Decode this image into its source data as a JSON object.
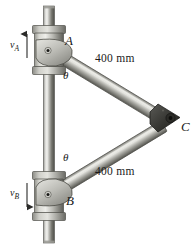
{
  "figure": {
    "name": "two-link-collar-mechanism",
    "background_color": "#ffffff",
    "width": 194,
    "height": 249
  },
  "labels": {
    "point_a": "A",
    "point_b": "B",
    "point_c": "C",
    "theta_top": "θ",
    "theta_bottom": "θ",
    "length_top": "400 mm",
    "length_bottom": "400 mm",
    "velocity_a": "v",
    "velocity_a_sub": "A",
    "velocity_b": "v",
    "velocity_b_sub": "B"
  },
  "geometry": {
    "shaft_x": 49,
    "shaft_top_y": 6,
    "shaft_bottom_y": 243,
    "shaft_width": 11,
    "collar_a_center": [
      49,
      50
    ],
    "collar_b_center": [
      49,
      196
    ],
    "pivot_a": [
      46,
      50
    ],
    "pivot_b": [
      46,
      196
    ],
    "joint_c": [
      171,
      118
    ],
    "link_top_angle_deg": 31,
    "link_bottom_angle_deg": -31
  },
  "colors": {
    "metal_light": "#e8e8e6",
    "metal_mid": "#b4b4b0",
    "metal_dark": "#6e6e6c",
    "metal_darkest": "#3a3a38",
    "outline": "#4a4a48",
    "pivot_dot": "#1c1c1a",
    "joint_c": "#343432",
    "text": "#1a1a1a",
    "arrow": "#2a2a28"
  },
  "arrows": {
    "velocity_a_direction": "up",
    "velocity_b_direction": "down"
  }
}
